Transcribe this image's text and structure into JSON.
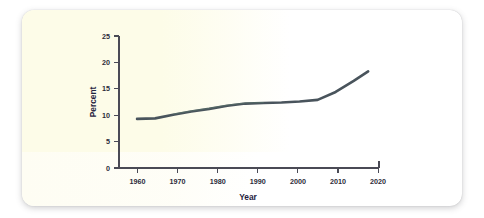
{
  "chart_data": {
    "type": "line",
    "title": "",
    "xlabel": "Year",
    "ylabel": "Percent",
    "xlim": [
      1955,
      2027
    ],
    "ylim": [
      0,
      25
    ],
    "xticks": [
      1960,
      1970,
      1980,
      1990,
      2000,
      2010,
      2020
    ],
    "yticks": [
      0,
      5,
      10,
      15,
      20,
      25
    ],
    "xtick_labels": [
      "1960",
      "1970",
      "1980",
      "1990",
      "2000",
      "2010",
      "2020"
    ],
    "ytick_labels": [
      "0",
      "5",
      "10",
      "15",
      "20",
      "25"
    ],
    "grid": false,
    "legend": false,
    "line_color": "#49545c",
    "series": [
      {
        "name": "Percent",
        "x": [
          1960,
          1965,
          1970,
          1975,
          1980,
          1985,
          1990,
          1995,
          2000,
          2005,
          2010,
          2015,
          2020,
          2024
        ],
        "values": [
          9.3,
          9.4,
          10.1,
          10.7,
          11.2,
          11.8,
          12.2,
          12.3,
          12.4,
          12.6,
          12.9,
          14.4,
          16.5,
          18.3
        ]
      }
    ]
  },
  "axis": {
    "y_title": "Percent",
    "x_title": "Year"
  }
}
